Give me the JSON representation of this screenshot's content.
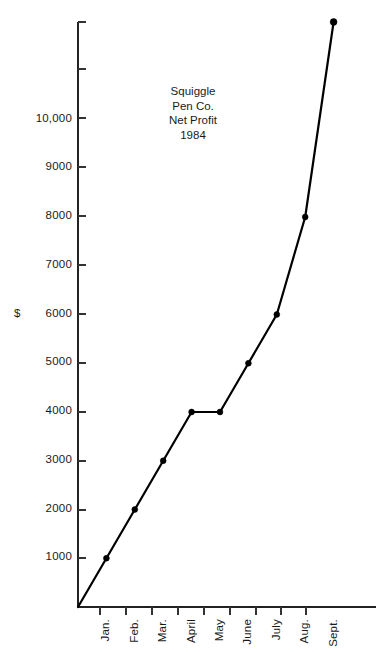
{
  "chart_data": {
    "type": "line",
    "title": "Squiggle Pen Co. Net Profit 1984",
    "title_lines": [
      "Squiggle",
      "Pen Co.",
      "Net Profit",
      "1984"
    ],
    "xlabel": "",
    "ylabel": "$",
    "categories": [
      "Jan.",
      "Feb.",
      "Mar.",
      "April",
      "May",
      "June",
      "July",
      "Aug.",
      "Sept."
    ],
    "values": [
      1000,
      2000,
      3000,
      4000,
      4000,
      5000,
      6000,
      8000,
      12000
    ],
    "origin_value": 0,
    "ytick_labels": [
      "10,000",
      "9000",
      "8000",
      "7000",
      "6000",
      "5000",
      "4000",
      "3000",
      "2000",
      "1000"
    ],
    "ytick_values": [
      10000,
      9000,
      8000,
      7000,
      6000,
      5000,
      4000,
      3000,
      2000,
      1000
    ],
    "ylim": [
      0,
      12000
    ],
    "ytick_interval": 1000,
    "unlabeled_top_ticks": [
      12000,
      11000
    ],
    "grid": false,
    "legend": "none",
    "line_color": "#000000",
    "marker_color": "#000000",
    "axis_color": "#222222",
    "background_color": "#ffffff",
    "marker_shape": "circle",
    "starts_at_origin": true
  }
}
